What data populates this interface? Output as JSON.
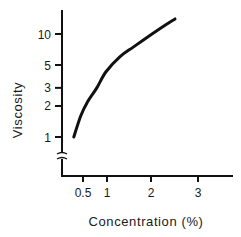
{
  "chart_data": {
    "type": "line",
    "title": "",
    "xlabel": "Concentration (%)",
    "ylabel": "Viscosity",
    "xscale": "linear",
    "yscale": "log",
    "xlim": [
      0,
      3.7
    ],
    "ylim": [
      1,
      16
    ],
    "y_axis_break": true,
    "grid": false,
    "legend": "none",
    "x_ticks": [
      {
        "value": 0.5,
        "label": "0.5"
      },
      {
        "value": 1,
        "label": "1"
      },
      {
        "value": 2,
        "label": "2"
      },
      {
        "value": 3,
        "label": "3"
      }
    ],
    "y_ticks": [
      {
        "value": 1,
        "label": "1"
      },
      {
        "value": 2,
        "label": "2"
      },
      {
        "value": 3,
        "label": "3"
      },
      {
        "value": 5,
        "label": "5"
      },
      {
        "value": 10,
        "label": "10"
      }
    ],
    "series": [
      {
        "name": "viscosity",
        "x": [
          0.3,
          0.45,
          0.6,
          0.8,
          1.0,
          1.3,
          1.6,
          2.0,
          2.3,
          2.5
        ],
        "y": [
          1.0,
          1.6,
          2.2,
          3.0,
          4.3,
          6.0,
          7.5,
          10.0,
          12.3,
          14.0
        ]
      }
    ]
  }
}
